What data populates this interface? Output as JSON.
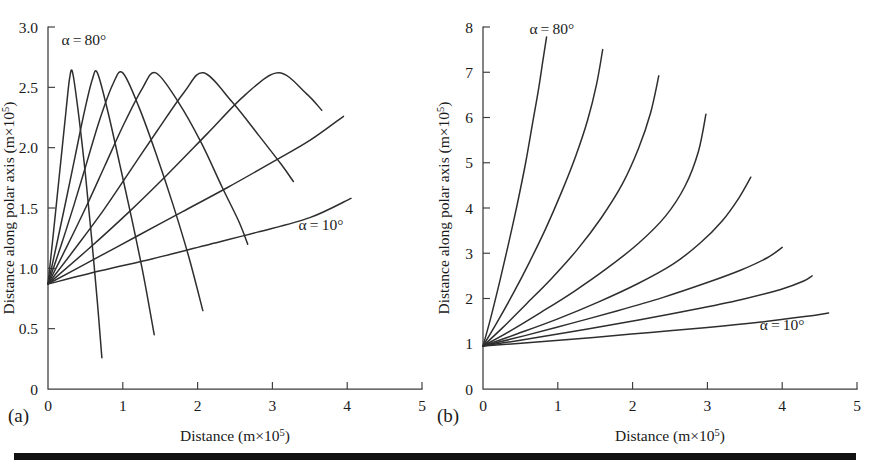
{
  "figure": {
    "panel_a_tag": "(a)",
    "panel_b_tag": "(b)"
  },
  "chart_data": [
    {
      "panel": "(a)",
      "type": "line",
      "title": "",
      "xlabel": "Distance (m×10⁵)",
      "ylabel": "Distance along polar axis (m×10⁵)",
      "xlabel_base": "Distance (m×10",
      "xlabel_exp": "5",
      "xlabel_tail": ")",
      "ylabel_base": "Distance along polar axis (m×10",
      "ylabel_exp": "5",
      "ylabel_tail": ")",
      "xlim": [
        0,
        5
      ],
      "ylim": [
        0,
        3.0
      ],
      "xticks": [
        0,
        1,
        2,
        3,
        4,
        5
      ],
      "xticklabels": [
        "0",
        "1",
        "2",
        "3",
        "4",
        "5"
      ],
      "yticks": [
        0,
        0.5,
        1.0,
        1.5,
        2.0,
        2.5,
        3.0
      ],
      "yticklabels": [
        "0",
        "0.5",
        "1.0",
        "1.5",
        "2.0",
        "2.5",
        "3.0"
      ],
      "grid": false,
      "legend": "none",
      "annotations": [
        {
          "text": "α = 80°",
          "x": 0.18,
          "y": 2.85
        },
        {
          "text": "α = 10°",
          "x": 3.35,
          "y": 1.32
        }
      ],
      "launch_point": [
        0.0,
        0.87
      ],
      "series": [
        {
          "name": "α = 80°",
          "x": [
            0.0,
            0.06,
            0.12,
            0.18,
            0.24,
            0.29,
            0.33,
            0.41,
            0.5,
            0.58,
            0.66,
            0.72
          ],
          "y": [
            0.87,
            1.22,
            1.58,
            1.94,
            2.3,
            2.58,
            2.62,
            2.27,
            1.78,
            1.27,
            0.72,
            0.26
          ]
        },
        {
          "name": "α = 70°",
          "x": [
            0.0,
            0.12,
            0.24,
            0.36,
            0.48,
            0.59,
            0.66,
            0.8,
            0.96,
            1.12,
            1.28,
            1.42
          ],
          "y": [
            0.87,
            1.21,
            1.56,
            1.92,
            2.28,
            2.56,
            2.62,
            2.3,
            1.86,
            1.41,
            0.93,
            0.45
          ]
        },
        {
          "name": "α = 60°",
          "x": [
            0.0,
            0.18,
            0.35,
            0.52,
            0.69,
            0.87,
            1.0,
            1.22,
            1.45,
            1.67,
            1.88,
            2.07
          ],
          "y": [
            0.87,
            1.2,
            1.53,
            1.88,
            2.23,
            2.53,
            2.62,
            2.33,
            1.94,
            1.53,
            1.1,
            0.65
          ]
        },
        {
          "name": "α = 50°",
          "x": [
            0.0,
            0.26,
            0.51,
            0.76,
            1.01,
            1.26,
            1.44,
            1.74,
            2.05,
            2.33,
            2.55,
            2.67
          ],
          "y": [
            0.87,
            1.19,
            1.51,
            1.85,
            2.19,
            2.49,
            2.62,
            2.38,
            2.04,
            1.67,
            1.39,
            1.2
          ]
        },
        {
          "name": "α = 40°",
          "x": [
            0.0,
            0.37,
            0.74,
            1.1,
            1.46,
            1.82,
            2.08,
            2.46,
            2.82,
            3.12,
            3.28
          ],
          "y": [
            0.87,
            1.17,
            1.48,
            1.81,
            2.14,
            2.46,
            2.62,
            2.38,
            2.1,
            1.86,
            1.72
          ]
        },
        {
          "name": "α = 30°",
          "x": [
            0.0,
            0.54,
            1.07,
            1.6,
            2.12,
            2.64,
            3.08,
            3.45,
            3.66
          ],
          "y": [
            0.87,
            1.16,
            1.46,
            1.78,
            2.11,
            2.44,
            2.62,
            2.45,
            2.31
          ]
        },
        {
          "name": "α = 20°",
          "x": [
            0.0,
            0.6,
            1.2,
            1.8,
            2.4,
            3.0,
            3.5,
            3.95
          ],
          "y": [
            0.87,
            1.07,
            1.27,
            1.47,
            1.67,
            1.88,
            2.06,
            2.26
          ]
        },
        {
          "name": "α = 10°",
          "x": [
            0.0,
            0.7,
            1.4,
            2.1,
            2.8,
            3.5,
            4.05
          ],
          "y": [
            0.87,
            0.98,
            1.08,
            1.19,
            1.3,
            1.42,
            1.58
          ]
        }
      ]
    },
    {
      "panel": "(b)",
      "type": "line",
      "title": "",
      "xlabel": "Distance (m×10⁵)",
      "ylabel": "Distance along polar axis (m×10⁵)",
      "xlabel_base": "Distance (m×10",
      "xlabel_exp": "5",
      "xlabel_tail": ")",
      "ylabel_base": "Distance along polar axis (m×10",
      "ylabel_exp": "5",
      "ylabel_tail": ")",
      "xlim": [
        0,
        5
      ],
      "ylim": [
        0,
        8
      ],
      "xticks": [
        0,
        1,
        2,
        3,
        4,
        5
      ],
      "xticklabels": [
        "0",
        "1",
        "2",
        "3",
        "4",
        "5"
      ],
      "yticks": [
        0,
        1,
        2,
        3,
        4,
        5,
        6,
        7,
        8
      ],
      "yticklabels": [
        "0",
        "1",
        "2",
        "3",
        "4",
        "5",
        "6",
        "7",
        "8"
      ],
      "grid": false,
      "legend": "none",
      "annotations": [
        {
          "text": "α = 80°",
          "x": 0.62,
          "y": 7.85
        },
        {
          "text": "α = 10°",
          "x": 3.7,
          "y": 1.3
        }
      ],
      "launch_point": [
        0.0,
        0.95
      ],
      "series": [
        {
          "name": "α = 80°",
          "x": [
            0.0,
            0.1,
            0.22,
            0.34,
            0.46,
            0.57,
            0.66,
            0.74,
            0.8,
            0.85
          ],
          "y": [
            0.95,
            1.55,
            2.35,
            3.2,
            4.1,
            5.0,
            5.85,
            6.6,
            7.25,
            7.78
          ]
        },
        {
          "name": "α = 70°",
          "x": [
            0.0,
            0.18,
            0.4,
            0.62,
            0.84,
            1.05,
            1.24,
            1.4,
            1.52,
            1.6
          ],
          "y": [
            0.95,
            1.45,
            2.1,
            2.8,
            3.55,
            4.35,
            5.15,
            5.95,
            6.75,
            7.5
          ]
        },
        {
          "name": "α = 60°",
          "x": [
            0.0,
            0.26,
            0.58,
            0.92,
            1.26,
            1.58,
            1.86,
            2.08,
            2.24,
            2.35
          ],
          "y": [
            0.95,
            1.35,
            1.88,
            2.45,
            3.08,
            3.78,
            4.52,
            5.32,
            6.1,
            6.92
          ]
        },
        {
          "name": "α = 50°",
          "x": [
            0.0,
            0.36,
            0.78,
            1.22,
            1.66,
            2.08,
            2.44,
            2.7,
            2.88,
            2.98
          ],
          "y": [
            0.95,
            1.28,
            1.7,
            2.16,
            2.67,
            3.22,
            3.82,
            4.48,
            5.25,
            6.07
          ]
        },
        {
          "name": "α = 40°",
          "x": [
            0.0,
            0.46,
            1.0,
            1.54,
            2.06,
            2.54,
            2.9,
            3.2,
            3.42,
            3.58
          ],
          "y": [
            0.95,
            1.22,
            1.55,
            1.92,
            2.32,
            2.76,
            3.22,
            3.72,
            4.22,
            4.68
          ]
        },
        {
          "name": "α = 30°",
          "x": [
            0.0,
            0.56,
            1.18,
            1.8,
            2.4,
            2.96,
            3.45,
            3.8,
            4.0
          ],
          "y": [
            0.95,
            1.18,
            1.45,
            1.73,
            2.02,
            2.33,
            2.63,
            2.9,
            3.13
          ]
        },
        {
          "name": "α = 20°",
          "x": [
            0.0,
            0.66,
            1.38,
            2.1,
            2.8,
            3.46,
            3.98,
            4.28,
            4.4
          ],
          "y": [
            0.95,
            1.12,
            1.32,
            1.53,
            1.75,
            1.98,
            2.2,
            2.38,
            2.5
          ]
        },
        {
          "name": "α = 10°",
          "x": [
            0.0,
            0.72,
            1.48,
            2.24,
            3.0,
            3.72,
            4.3,
            4.62
          ],
          "y": [
            0.95,
            1.04,
            1.14,
            1.25,
            1.36,
            1.48,
            1.6,
            1.68
          ]
        }
      ]
    }
  ]
}
